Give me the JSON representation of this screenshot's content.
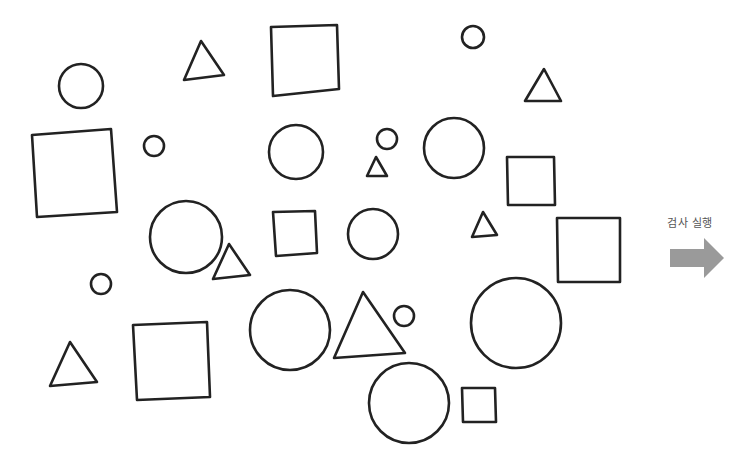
{
  "run_button": {
    "label": "검사 실행",
    "arrow_color": "#9a9a9a",
    "icon": "right-arrow-icon"
  },
  "stroke_color": "#222222",
  "shapes": {
    "circles": [
      {
        "cx": 81,
        "cy": 86,
        "r": 22
      },
      {
        "cx": 154,
        "cy": 146,
        "r": 10
      },
      {
        "cx": 186,
        "cy": 237,
        "r": 36
      },
      {
        "cx": 101,
        "cy": 284,
        "r": 10
      },
      {
        "cx": 296,
        "cy": 152,
        "r": 27
      },
      {
        "cx": 387,
        "cy": 139,
        "r": 10
      },
      {
        "cx": 454,
        "cy": 148,
        "r": 30
      },
      {
        "cx": 473,
        "cy": 37,
        "r": 11
      },
      {
        "cx": 373,
        "cy": 234,
        "r": 25
      },
      {
        "cx": 290,
        "cy": 330,
        "r": 40
      },
      {
        "cx": 404,
        "cy": 316,
        "r": 10
      },
      {
        "cx": 516,
        "cy": 323,
        "r": 45
      },
      {
        "cx": 409,
        "cy": 403,
        "r": 40
      }
    ],
    "squares": [
      {
        "points": "32,135 111,129 117,212 37,217"
      },
      {
        "points": "271,27 337,25 339,89 273,96"
      },
      {
        "points": "507,157 554,157 555,205 508,205"
      },
      {
        "points": "273,212 315,211 317,253 276,256"
      },
      {
        "points": "557,218 620,218 620,282 558,282"
      },
      {
        "points": "133,325 207,322 210,397 137,400"
      },
      {
        "points": "462,388 495,388 496,422 463,422"
      }
    ],
    "triangles": [
      {
        "points": "201,41 224,75 184,80"
      },
      {
        "points": "544,69 561,101 525,101"
      },
      {
        "points": "376,157 387,176 367,176"
      },
      {
        "points": "229,244 250,275 213,279"
      },
      {
        "points": "483,212 497,235 472,237"
      },
      {
        "points": "70,342 97,382 50,386"
      },
      {
        "points": "363,292 405,353 334,358"
      }
    ]
  }
}
